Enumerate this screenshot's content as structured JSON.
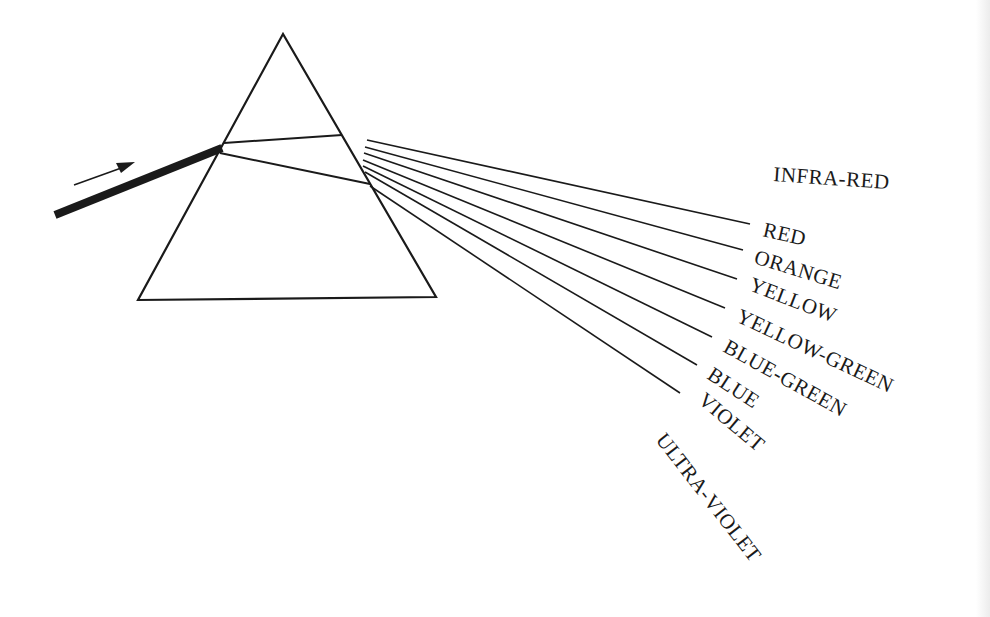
{
  "diagram": {
    "colors": {
      "ink": "#1a1a1a",
      "background": "#ffffff"
    },
    "prism": {
      "apex": [
        283,
        34
      ],
      "base_left": [
        138,
        300
      ],
      "base_right": [
        436,
        297
      ]
    },
    "incident_beam": {
      "from": [
        55,
        215
      ],
      "to": [
        222,
        148
      ],
      "width": 7
    },
    "direction_arrow": {
      "from": [
        74,
        185
      ],
      "to": [
        134,
        163
      ],
      "icon": "arrow-right-icon"
    },
    "labels": {
      "infra_red": "INFRA-RED",
      "red": "RED",
      "orange": "ORANGE",
      "yellow": "YELLOW",
      "yellow_green": "YELLOW-GREEN",
      "blue_green": "BLUE-GREEN",
      "blue": "BLUE",
      "violet": "VIOLET",
      "ultra_violet": "ULTRA-VIOLET"
    }
  }
}
